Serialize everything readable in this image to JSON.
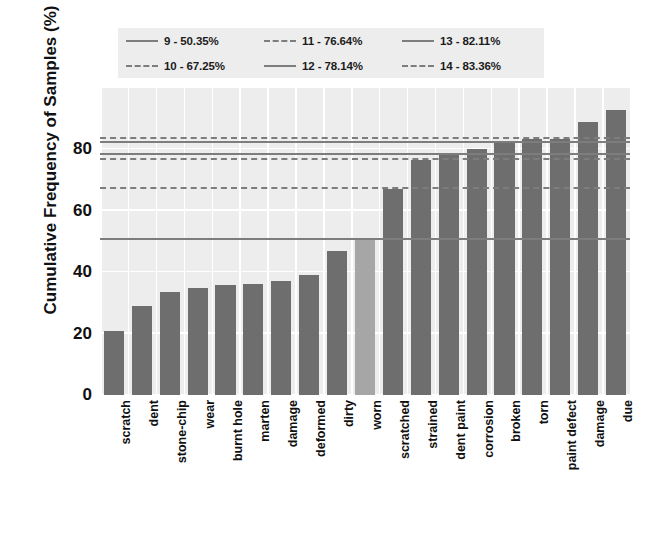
{
  "chart_data": {
    "type": "bar",
    "title": "",
    "xlabel": "",
    "ylabel": "Cumulative Frequency of Samples (%)",
    "ylim": [
      0,
      100
    ],
    "yticks": [
      0,
      20,
      40,
      60,
      80
    ],
    "grid": true,
    "legend_position": "top",
    "categories": [
      "scratch",
      "dent",
      "stone-chip",
      "wear",
      "burnt hole",
      "marten",
      "damage",
      "deformed",
      "dirty",
      "worn",
      "scratched",
      "strained",
      "dent paint",
      "corrosion",
      "broken",
      "torn",
      "paint defect",
      "damage",
      "due"
    ],
    "values": [
      21.0,
      29.0,
      33.5,
      35.0,
      35.8,
      36.3,
      37.0,
      39.0,
      47.0,
      50.35,
      67.25,
      76.64,
      78.14,
      80.0,
      82.11,
      83.36,
      83.36,
      89.0,
      93.0
    ],
    "highlight_index": 9,
    "bar_color": "#6e6e6e",
    "highlight_color": "#a6a6a6",
    "reference_lines": [
      {
        "id": "9",
        "value": 50.35,
        "label": "9 - 50.35%",
        "style": "solid"
      },
      {
        "id": "10",
        "value": 67.25,
        "label": "10 - 67.25%",
        "style": "dashed"
      },
      {
        "id": "11",
        "value": 76.64,
        "label": "11 - 76.64%",
        "style": "dashed"
      },
      {
        "id": "12",
        "value": 78.14,
        "label": "12 - 78.14%",
        "style": "solid"
      },
      {
        "id": "13",
        "value": 82.11,
        "label": "13 - 82.11%",
        "style": "solid"
      },
      {
        "id": "14",
        "value": 83.36,
        "label": "14 - 83.36%",
        "style": "dashed"
      }
    ],
    "reference_line_color": "#7d7d7d"
  },
  "legend": {
    "order": [
      0,
      2,
      4,
      1,
      3,
      5
    ]
  }
}
